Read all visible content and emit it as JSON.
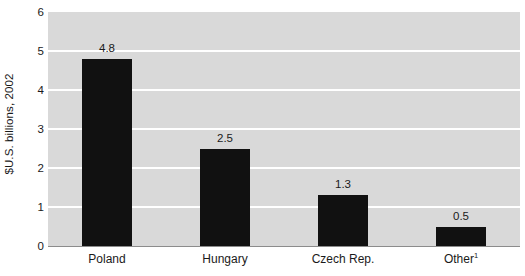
{
  "chart_data": {
    "type": "bar",
    "title": "",
    "subtitle": "",
    "xlabel": "",
    "ylabel": "$U.S. billions, 2002",
    "categories": [
      "Poland",
      "Hungary",
      "Czech Rep.",
      "Other"
    ],
    "category_footnotes": [
      "",
      "",
      "",
      "1"
    ],
    "values": [
      4.8,
      2.5,
      1.3,
      0.5
    ],
    "value_labels": [
      "4.8",
      "2.5",
      "1.3",
      "0.5"
    ],
    "ylim": [
      0,
      6
    ],
    "yticks": [
      6,
      5,
      4,
      3,
      2,
      1,
      0
    ],
    "ytick_labels": [
      "6",
      "5",
      "4",
      "3",
      "2",
      "1",
      "0"
    ],
    "grid": true,
    "grid_axis": "y",
    "legend": false,
    "legend_position": "none",
    "colors": {
      "bar": "#111111",
      "plot_background": "#d9d9d9",
      "gridline": "#ffffff",
      "axis_line": "#8c8c8c",
      "text": "#1a1a1a",
      "page_background": "#ffffff"
    }
  }
}
